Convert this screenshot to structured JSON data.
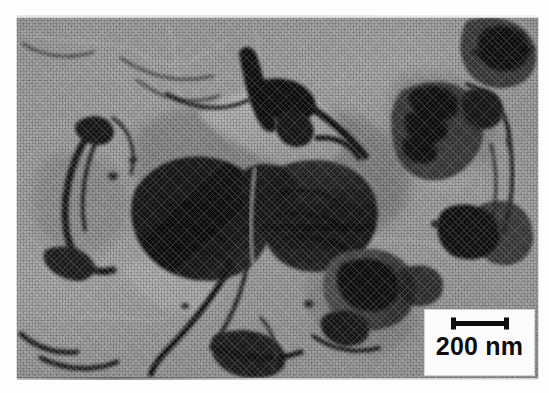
{
  "figure": {
    "kind": "tem-micrograph",
    "modality": "Transmission electron microscopy (TEM) bright-field image",
    "rendering": "Grayscale halftone scan of a printed plate",
    "background_tone": "#9a9a9a",
    "darkest_tone": "#0a0a0a",
    "lightest_tone": "#d8d8d8",
    "plate": {
      "left": 17,
      "top": 18,
      "width": 521,
      "height": 360
    }
  },
  "scalebar": {
    "label": "200 nm",
    "value": 200,
    "unit": "nm",
    "glyph": "i-beam-scale-bar",
    "bar_length_px": 56,
    "box": {
      "left": 424,
      "top": 309,
      "width": 111,
      "height": 67,
      "fill": "#fbfbfb",
      "ink": "#0d0d0d"
    }
  },
  "features": [
    {
      "id": "central-platelet-cluster",
      "name": "Central dark nanoplatelet aggregate",
      "tone": "very dark",
      "note": "Large folded sheet with sharp faceted bend contours through the middle of the frame"
    },
    {
      "id": "left-curved-sheet",
      "name": "Curved thin sheet, left edge",
      "tone": "mid dark",
      "note": "Hook-shaped fold contour near the left margin"
    },
    {
      "id": "right-striped-platelet",
      "name": "Striped platelet, right side",
      "tone": "dark with banding",
      "note": "Bend-contour fringes running roughly vertically"
    },
    {
      "id": "upper-right-particle",
      "name": "Dark particle, top-right corner",
      "tone": "dark",
      "note": "Small elongated crystallite partly cut by the frame edge"
    },
    {
      "id": "lower-right-flake",
      "name": "Flake cluster, lower right",
      "tone": "dark",
      "note": "Angular overlapping flakes above the scale-bar box"
    },
    {
      "id": "support-film-folds",
      "name": "Carbon support film wrinkles",
      "tone": "light gray lines",
      "note": "Faint meandering creases across the otherwise uniform background"
    }
  ]
}
